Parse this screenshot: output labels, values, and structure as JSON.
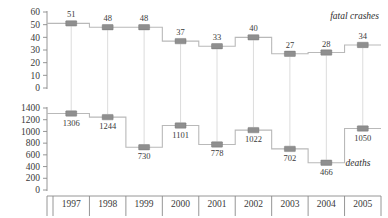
{
  "chart_data": {
    "type": "line",
    "subtype": "step",
    "categories": [
      "1997",
      "1998",
      "1999",
      "2000",
      "2001",
      "2002",
      "2003",
      "2004",
      "2005"
    ],
    "title": "",
    "xlabel": "",
    "grid": false,
    "legend_position": "inline-right",
    "panels": [
      {
        "name": "fatal-crashes",
        "label": "fatal crashes",
        "ylabel": "",
        "ylim": [
          0,
          60
        ],
        "yticks": [
          0,
          10,
          20,
          30,
          40,
          50,
          60
        ],
        "ytick_labels": [
          "0",
          "10",
          "20",
          "30",
          "40",
          "50",
          "60"
        ],
        "values": [
          51,
          48,
          48,
          37,
          33,
          40,
          27,
          28,
          34
        ],
        "value_labels": [
          "51",
          "48",
          "48",
          "37",
          "33",
          "40",
          "27",
          "28",
          "34"
        ],
        "label_position": "above"
      },
      {
        "name": "deaths",
        "label": "deaths",
        "ylabel": "",
        "ylim": [
          0,
          1400
        ],
        "yticks": [
          0,
          200,
          400,
          600,
          800,
          1000,
          1200,
          1400
        ],
        "ytick_labels": [
          "0",
          "200",
          "400",
          "600",
          "800",
          "1000",
          "1200",
          "1400"
        ],
        "values": [
          1306,
          1244,
          730,
          1101,
          778,
          1022,
          702,
          466,
          1050
        ],
        "value_labels": [
          "1306",
          "1244",
          "730",
          "1101",
          "778",
          "1022",
          "702",
          "466",
          "1050"
        ],
        "label_position": "below"
      }
    ],
    "colors": {
      "marker": "#8f8f8f",
      "step_line": "#b9b9b9",
      "drop_line": "#d8d8d8",
      "axis": "#8a8a8a",
      "text": "#3a3a3a"
    }
  }
}
